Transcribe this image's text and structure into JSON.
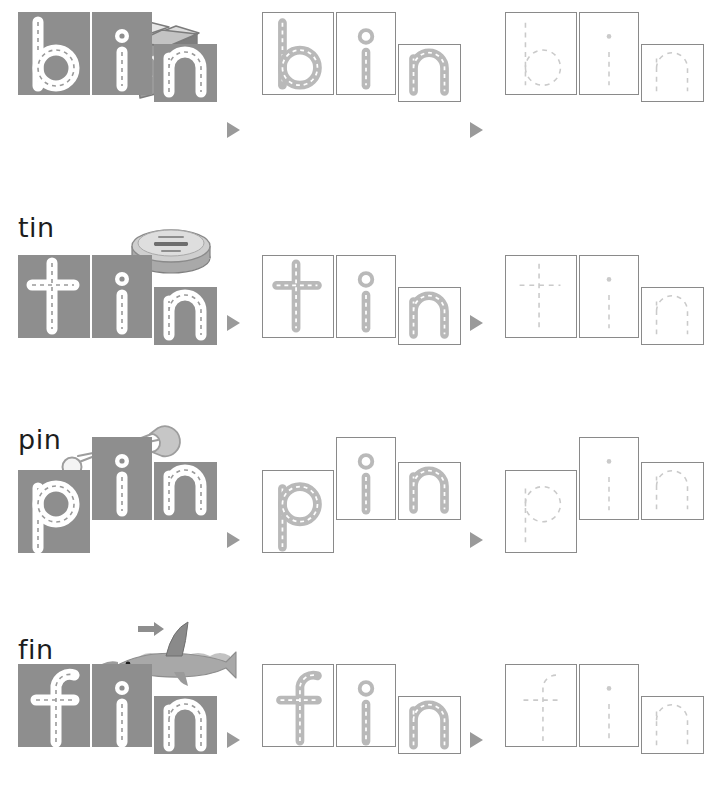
{
  "worksheet": {
    "title": "Word Building Trace Worksheet",
    "colors": {
      "box_fill": "#8e8e8e",
      "box_outline": "#8a8a8a",
      "road_white": "#ffffff",
      "road_gray": "#b9b9b9",
      "trace_dash": "#c9c9c9",
      "arrow": "#9a9a9a",
      "label_text": "#1d1d1d"
    },
    "stages": [
      {
        "name": "filled",
        "description": "solid gray letter tiles with white road letters"
      },
      {
        "name": "outlined",
        "description": "outlined tiles with gray road letters"
      },
      {
        "name": "trace",
        "description": "outlined tiles with dashed trace letters"
      }
    ],
    "arrow_glyph": "▶",
    "rows": [
      {
        "word": "bin",
        "label": "bin",
        "picture": "recycling-bin-picture",
        "picture_name": "recycling bin",
        "letters": [
          {
            "char": "b",
            "kind": "ascender"
          },
          {
            "char": "i",
            "kind": "ascender"
          },
          {
            "char": "n",
            "kind": "xheight"
          }
        ]
      },
      {
        "word": "tin",
        "label": "tin",
        "picture": "tin-can-picture",
        "picture_name": "tin can",
        "letters": [
          {
            "char": "t",
            "kind": "ascender"
          },
          {
            "char": "i",
            "kind": "ascender"
          },
          {
            "char": "n",
            "kind": "xheight"
          }
        ]
      },
      {
        "word": "pin",
        "label": "pin",
        "picture": "safety-pin-picture",
        "picture_name": "safety pin",
        "letters": [
          {
            "char": "p",
            "kind": "descender"
          },
          {
            "char": "i",
            "kind": "ascender"
          },
          {
            "char": "n",
            "kind": "xheight"
          }
        ]
      },
      {
        "word": "fin",
        "label": "fin",
        "picture": "fish-fin-picture",
        "picture_name": "fish fin",
        "letters": [
          {
            "char": "f",
            "kind": "ascender"
          },
          {
            "char": "i",
            "kind": "ascender"
          },
          {
            "char": "n",
            "kind": "xheight"
          }
        ]
      }
    ]
  }
}
